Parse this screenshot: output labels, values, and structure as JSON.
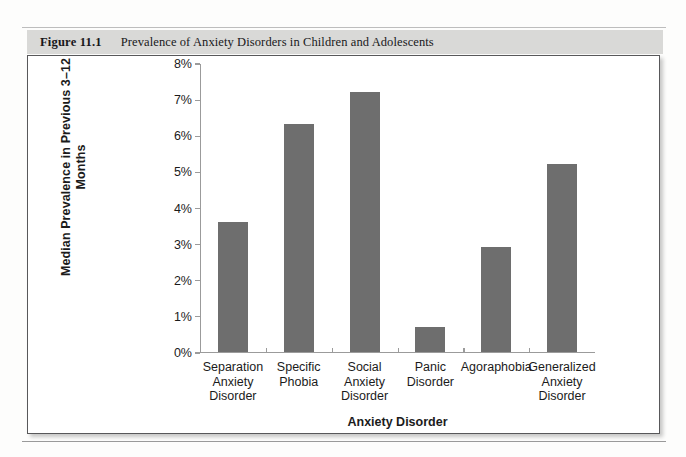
{
  "page": {
    "ghost_top_text": "",
    "ghost_bottom_text": ""
  },
  "caption": {
    "number": "Figure 11.1",
    "text": "Prevalence of Anxiety Disorders in Children and Adolescents"
  },
  "colors": {
    "bar_fill": "#6e6e6e",
    "banner": "#d9d9d7",
    "frame_border": "#58585a",
    "axis": "#9b9b9b"
  },
  "chart_data": {
    "type": "bar",
    "title": "Prevalence of Anxiety Disorders in Children and Adolescents",
    "xlabel": "Anxiety Disorder",
    "ylabel": "Median Prevalence in Previous 3–12 Months",
    "categories": [
      "Separation\nAnxiety\nDisorder",
      "Specific\nPhobia",
      "Social\nAnxiety\nDisorder",
      "Panic\nDisorder",
      "Agoraphobia",
      "Generalized\nAnxiety\nDisorder"
    ],
    "values": [
      3.6,
      6.3,
      7.2,
      0.7,
      2.9,
      5.2
    ],
    "ylim": [
      0,
      8
    ],
    "ytick_values": [
      0,
      1,
      2,
      3,
      4,
      5,
      6,
      7,
      8
    ],
    "ytick_labels": [
      "0%",
      "1%",
      "2%",
      "3%",
      "4%",
      "5%",
      "6%",
      "7%",
      "8%"
    ],
    "grid": false,
    "legend": null
  }
}
